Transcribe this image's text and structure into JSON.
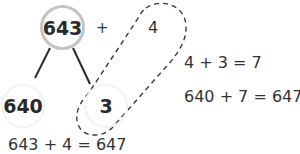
{
  "diagram": {
    "type": "number-bond-addition",
    "top_number": "643",
    "operator": "+",
    "addend": "4",
    "partition": {
      "left": "640",
      "right": "3"
    },
    "grouping_note": "dashed outline groups the addend 4 with the part 3",
    "steps": [
      "4 + 3 = 7",
      "640 + 7 = 647"
    ],
    "result_equation": "643 + 4 = 647"
  },
  "colors": {
    "text": "#2b2b2b",
    "top_circle_border": "#c4c4c4",
    "part_circle_border": "#f3f3f3",
    "lines": "#2a2a2a",
    "dashed_outline": "#3a3a3a"
  }
}
